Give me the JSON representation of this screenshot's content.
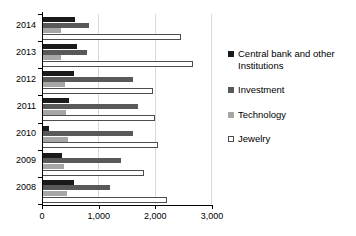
{
  "chart_data": {
    "type": "bar",
    "orientation": "horizontal",
    "title": "",
    "subtitle": "",
    "xlabel": "",
    "ylabel": "",
    "categories": [
      "2014",
      "2013",
      "2012",
      "2011",
      "2010",
      "2009",
      "2008"
    ],
    "series": [
      {
        "name": "Central bank and other Institutions",
        "color": "#1a1a1a",
        "values": [
          580,
          620,
          560,
          480,
          120,
          350,
          570
        ]
      },
      {
        "name": "Investment",
        "color": "#595959",
        "values": [
          830,
          790,
          1600,
          1700,
          1600,
          1400,
          1200
        ]
      },
      {
        "name": "Technology",
        "color": "#a6a6a6",
        "values": [
          330,
          340,
          400,
          430,
          450,
          380,
          440
        ]
      },
      {
        "name": "Jewelry",
        "color": "#ffffff",
        "values": [
          2450,
          2670,
          1950,
          1990,
          2040,
          1800,
          2200
        ]
      }
    ],
    "xlim": [
      0,
      3000
    ],
    "xticks": [
      0,
      1000,
      2000,
      3000
    ],
    "xticklabels": [
      "0",
      "1,000",
      "2,000",
      "3,000"
    ],
    "grid": true,
    "grid_axis": "x",
    "legend_position": "right",
    "legend": [
      "Central bank and other Institutions",
      "Investment",
      "Technology",
      "Jewelry"
    ]
  }
}
